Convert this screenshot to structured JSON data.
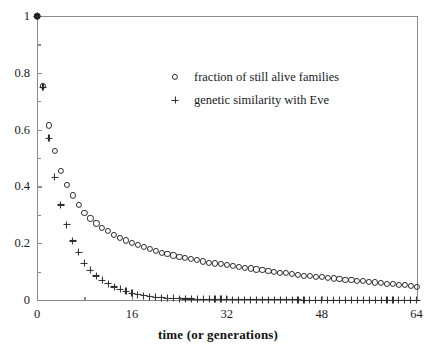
{
  "chart_data": {
    "type": "scatter",
    "title": "",
    "xlabel": "time (or generations)",
    "ylabel": "",
    "xlim": [
      0,
      64
    ],
    "ylim": [
      0,
      1
    ],
    "grid": false,
    "legend_position": "upper-center",
    "xticks": [
      0,
      16,
      32,
      48,
      64
    ],
    "xtick_labels": [
      "0",
      "16",
      "32",
      "48",
      "64"
    ],
    "xticks_minor": [
      8,
      24,
      40,
      56
    ],
    "yticks": [
      0,
      0.2,
      0.4,
      0.6,
      0.8,
      1
    ],
    "ytick_labels": [
      "0",
      "0.2",
      "0.4",
      "0.6",
      "0.8",
      "1"
    ],
    "yticks_minor": [
      0.1,
      0.3,
      0.5,
      0.7,
      0.9
    ],
    "marker_color": "#2a2a2a",
    "axis_color": "#8b8b8b",
    "background": "#ffffff",
    "x": [
      0,
      1,
      2,
      3,
      4,
      5,
      6,
      7,
      8,
      9,
      10,
      11,
      12,
      13,
      14,
      15,
      16,
      17,
      18,
      19,
      20,
      21,
      22,
      23,
      24,
      25,
      26,
      27,
      28,
      29,
      30,
      31,
      32,
      33,
      34,
      35,
      36,
      37,
      38,
      39,
      40,
      41,
      42,
      43,
      44,
      45,
      46,
      47,
      48,
      49,
      50,
      51,
      52,
      53,
      54,
      55,
      56,
      57,
      58,
      59,
      60,
      61,
      62,
      63,
      64
    ],
    "series": [
      {
        "name": "fraction of still alive families",
        "marker": "circle",
        "values": [
          1.0,
          0.755,
          0.615,
          0.525,
          0.455,
          0.405,
          0.368,
          0.335,
          0.308,
          0.287,
          0.27,
          0.255,
          0.242,
          0.23,
          0.22,
          0.21,
          0.201,
          0.193,
          0.186,
          0.179,
          0.173,
          0.167,
          0.162,
          0.157,
          0.152,
          0.148,
          0.144,
          0.14,
          0.136,
          0.132,
          0.129,
          0.126,
          0.123,
          0.12,
          0.117,
          0.114,
          0.111,
          0.108,
          0.105,
          0.102,
          0.099,
          0.096,
          0.094,
          0.091,
          0.089,
          0.086,
          0.084,
          0.082,
          0.08,
          0.078,
          0.076,
          0.074,
          0.072,
          0.07,
          0.068,
          0.066,
          0.064,
          0.062,
          0.06,
          0.058,
          0.056,
          0.054,
          0.052,
          0.049,
          0.045
        ]
      },
      {
        "name": "genetic similarity with Eve",
        "marker": "plus",
        "values": [
          1.0,
          0.75,
          0.57,
          0.432,
          0.335,
          0.265,
          0.208,
          0.168,
          0.13,
          0.105,
          0.085,
          0.07,
          0.057,
          0.046,
          0.037,
          0.03,
          0.024,
          0.019,
          0.015,
          0.012,
          0.01,
          0.008,
          0.007,
          0.006,
          0.005,
          0.004,
          0.004,
          0.003,
          0.003,
          0.002,
          0.002,
          0.002,
          0.002,
          0.001,
          0.001,
          0.001,
          0.001,
          0.001,
          0.001,
          0.001,
          0.001,
          0.001,
          0.001,
          0.001,
          0.001,
          0.0,
          0.0,
          0.0,
          0.0,
          0.0,
          0.0,
          0.0,
          0.0,
          0.0,
          0.0,
          0.0,
          0.0,
          0.0,
          0.0,
          0.0,
          0.0,
          0.0,
          0.0,
          0.0,
          0.0
        ]
      }
    ]
  }
}
